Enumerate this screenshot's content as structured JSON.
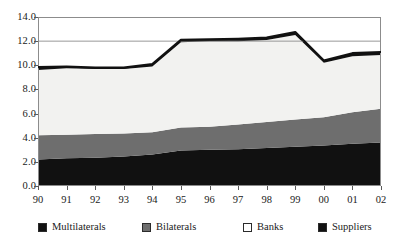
{
  "chart_data": {
    "type": "area",
    "stacked": true,
    "title": "",
    "subtitle": "",
    "xlabel": "",
    "ylabel": "",
    "categories": [
      "90",
      "91",
      "92",
      "93",
      "94",
      "95",
      "96",
      "97",
      "98",
      "99",
      "00",
      "01",
      "02"
    ],
    "x_tick_labels": [
      "90",
      "91",
      "92",
      "93",
      "94",
      "95",
      "96",
      "97",
      "98",
      "99",
      "00",
      "01",
      "02"
    ],
    "y_tick_labels": [
      "0.0",
      "2.0",
      "4.0",
      "6.0",
      "8.0",
      "10.0",
      "12.0",
      "14.0"
    ],
    "y_tick_values": [
      0.0,
      2.0,
      4.0,
      6.0,
      8.0,
      10.0,
      12.0,
      14.0
    ],
    "ylim": [
      0.0,
      14.0
    ],
    "grid": "horizontal-at-12-only",
    "legend_position": "bottom",
    "series": [
      {
        "name": "Multilaterals",
        "color": "#111111",
        "values": [
          2.2,
          2.3,
          2.35,
          2.45,
          2.6,
          2.95,
          3.0,
          3.05,
          3.15,
          3.25,
          3.35,
          3.5,
          3.6
        ]
      },
      {
        "name": "Bilaterals",
        "color": "#6e6e6e",
        "values": [
          2.0,
          1.95,
          1.95,
          1.9,
          1.85,
          1.9,
          1.9,
          2.05,
          2.15,
          2.25,
          2.35,
          2.6,
          2.8
        ]
      },
      {
        "name": "Banks",
        "color": "#f2f2f0",
        "values": [
          5.4,
          5.5,
          5.4,
          5.35,
          5.45,
          7.05,
          7.1,
          6.9,
          6.8,
          7.0,
          4.5,
          4.65,
          4.45
        ]
      },
      {
        "name": "Suppliers",
        "color": "#111111",
        "values": [
          0.25,
          0.15,
          0.1,
          0.1,
          0.2,
          0.2,
          0.15,
          0.2,
          0.2,
          0.25,
          0.2,
          0.25,
          0.25
        ]
      }
    ],
    "cumulative_totals": [
      9.85,
      9.9,
      9.75,
      9.7,
      9.95,
      12.1,
      12.15,
      12.2,
      12.3,
      12.75,
      10.4,
      11.0,
      11.1
    ]
  },
  "legend": {
    "items": [
      {
        "label": "Multilaterals",
        "swatch_color": "#111111"
      },
      {
        "label": "Bilaterals",
        "swatch_color": "#6e6e6e"
      },
      {
        "label": "Banks",
        "swatch_color": "#ffffff"
      },
      {
        "label": "Suppliers",
        "swatch_color": "#111111"
      }
    ]
  },
  "axes": {
    "frame_color": "#8c8c8c",
    "gridline_color": "#8c8c8c",
    "tick_color": "#5a5a5a"
  }
}
